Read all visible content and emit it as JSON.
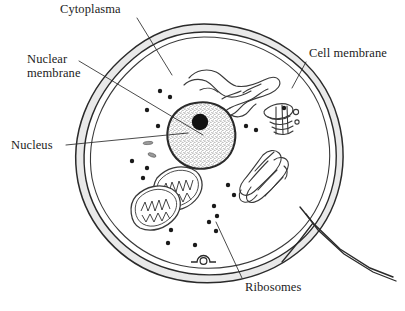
{
  "diagram": {
    "background_color": "#ffffff",
    "ink_color": "#1c1c1c",
    "membrane_fill_color": "#e9e9e9",
    "nucleus_fill_color": "#d8d8d8",
    "nucleolus_color": "#111111",
    "ribosome_color": "#1a1a1a"
  },
  "labels": {
    "cytoplasma": "Cytoplasma",
    "nuclear_membrane_line1": "Nuclear",
    "nuclear_membrane_line2": "membrane",
    "nucleus": "Nucleus",
    "cell_membrane": "Cell membrane",
    "ribosomes": "Ribosomes"
  },
  "footer": {
    "clipped_caption": ""
  },
  "structures": [
    {
      "name": "cell-membrane",
      "label": "Cell membrane",
      "description": "Outer double-walled boundary of the cell, shaded band"
    },
    {
      "name": "cytoplasm",
      "label": "Cytoplasma",
      "description": "Interior fluid region enclosed by the cell membrane"
    },
    {
      "name": "nuclear-membrane",
      "label": "Nuclear membrane",
      "description": "Dark outline enclosing the nucleus"
    },
    {
      "name": "nucleus",
      "label": "Nucleus",
      "description": "Large stippled oval body containing the nucleolus"
    },
    {
      "name": "nucleolus",
      "label": "Nucleolus",
      "description": "Solid black circle inside the nucleus"
    },
    {
      "name": "ribosomes",
      "label": "Ribosomes",
      "description": "Small black dots scattered through the cytoplasm"
    },
    {
      "name": "endoplasmic-reticulum",
      "label": "Endoplasmic reticulum",
      "description": "Branching finger-like tubules above the nucleus"
    },
    {
      "name": "golgi-apparatus",
      "label": "Golgi apparatus",
      "description": "Stacked flattened sacs at right of cell"
    },
    {
      "name": "mitochondrion-1",
      "label": "Mitochondrion",
      "description": "Elongated organelle with internal cristae, lower left"
    },
    {
      "name": "mitochondrion-2",
      "label": "Mitochondrion",
      "description": "Second elongated organelle with cristae, lower left"
    },
    {
      "name": "lysosomes",
      "label": "Lysosomes",
      "description": "Small elongated vesicles left of the nucleus"
    },
    {
      "name": "membrane-pore",
      "label": "Membrane pore",
      "description": "Small circular opening at bottom of membrane"
    },
    {
      "name": "membrane-extension",
      "label": "Membrane extension",
      "description": "Tail-like branch of membrane at lower right"
    }
  ],
  "leader_lines": [
    {
      "name": "leader-cytoplasma",
      "from": "Cytoplasma",
      "to": "cytoplasm"
    },
    {
      "name": "leader-nuclear-membrane",
      "from": "Nuclear membrane",
      "to": "nuclear-membrane"
    },
    {
      "name": "leader-nucleus",
      "from": "Nucleus",
      "to": "nucleus"
    },
    {
      "name": "leader-cell-membrane",
      "from": "Cell membrane",
      "to": "cell-membrane"
    },
    {
      "name": "leader-ribosomes",
      "from": "Ribosomes",
      "to": "ribosomes"
    }
  ]
}
